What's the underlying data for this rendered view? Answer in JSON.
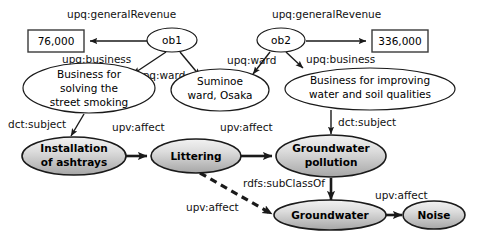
{
  "diagram": {
    "nodes": {
      "literal_revenue_left": {
        "label": "76,000",
        "shape": "rectangle",
        "style": "literal"
      },
      "literal_revenue_right": {
        "label": "336,000",
        "shape": "rectangle",
        "style": "literal"
      },
      "ob1": {
        "label": "ob1",
        "shape": "ellipse",
        "style": "plain"
      },
      "ob2": {
        "label": "ob2",
        "shape": "ellipse",
        "style": "plain"
      },
      "business_smoking": {
        "line1": "Business for",
        "line2": "solving the",
        "line3": "street smoking",
        "shape": "ellipse",
        "style": "plain"
      },
      "suminoe_ward": {
        "line1": "Suminoe",
        "line2": "ward, Osaka",
        "shape": "ellipse",
        "style": "plain"
      },
      "business_water_soil": {
        "line1": "Business for improving",
        "line2": "water and soil qualities",
        "shape": "ellipse",
        "style": "plain"
      },
      "installation_of_ashtrays": {
        "line1": "Installation",
        "line2": "of ashtrays",
        "shape": "ellipse",
        "style": "shaded"
      },
      "littering": {
        "line1": "Littering",
        "shape": "ellipse",
        "style": "shaded"
      },
      "groundwater_pollution": {
        "line1": "Groundwater",
        "line2": "pollution",
        "shape": "ellipse",
        "style": "shaded"
      },
      "groundwater": {
        "line1": "Groundwater",
        "shape": "ellipse",
        "style": "shaded"
      },
      "noise": {
        "line1": "Noise",
        "shape": "ellipse",
        "style": "shaded"
      }
    },
    "edges": [
      {
        "id": "e1",
        "from": "ob1",
        "to": "literal_revenue_left",
        "label": "upq:generalRevenue",
        "style": "solid"
      },
      {
        "id": "e2",
        "from": "ob1",
        "to": "business_smoking",
        "label": "upq:business",
        "style": "solid"
      },
      {
        "id": "e3",
        "from": "ob1",
        "to": "suminoe_ward",
        "label": "upq:ward",
        "style": "solid"
      },
      {
        "id": "e4",
        "from": "ob2",
        "to": "literal_revenue_right",
        "label": "upq:generalRevenue",
        "style": "solid"
      },
      {
        "id": "e5",
        "from": "ob2",
        "to": "suminoe_ward",
        "label": "upq:ward",
        "style": "solid"
      },
      {
        "id": "e6",
        "from": "ob2",
        "to": "business_water_soil",
        "label": "upq:business",
        "style": "solid"
      },
      {
        "id": "e7",
        "from": "business_smoking",
        "to": "installation_of_ashtrays",
        "label": "dct:subject",
        "style": "solid"
      },
      {
        "id": "e8",
        "from": "business_water_soil",
        "to": "groundwater_pollution",
        "label": "dct:subject",
        "style": "solid"
      },
      {
        "id": "e9",
        "from": "installation_of_ashtrays",
        "to": "littering",
        "label": "upv:affect",
        "style": "thick"
      },
      {
        "id": "e10",
        "from": "littering",
        "to": "groundwater_pollution",
        "label": "upv:affect",
        "style": "thick"
      },
      {
        "id": "e11",
        "from": "groundwater_pollution",
        "to": "groundwater",
        "label": "rdfs:subClassOf",
        "style": "thick"
      },
      {
        "id": "e12",
        "from": "groundwater",
        "to": "littering",
        "label": "upv:affect",
        "style": "dashed"
      },
      {
        "id": "e13",
        "from": "groundwater",
        "to": "noise",
        "label": "upv:affect",
        "style": "thick"
      }
    ],
    "labels": {
      "upq_generalRevenue_left": "upq:generalRevenue",
      "upq_generalRevenue_right": "upq:generalRevenue",
      "upq_business_left": "upq:business",
      "upq_business_right": "upq:business",
      "upq_ward_left": "upq:ward",
      "upq_ward_right": "upq:ward",
      "dct_subject_left": "dct:subject",
      "dct_subject_right": "dct:subject",
      "upv_affect_1": "upv:affect",
      "upv_affect_2": "upv:affect",
      "upv_affect_3": "upv:affect",
      "upv_affect_4": "upv:affect",
      "rdfs_subclassof": "rdfs:subClassOf"
    },
    "colors": {
      "background": "#ffffff",
      "stroke": "#1a1a1a",
      "shaded_fill_top": "#efefef",
      "shaded_fill_bottom": "#a8a8a8",
      "text": "#000000"
    }
  }
}
